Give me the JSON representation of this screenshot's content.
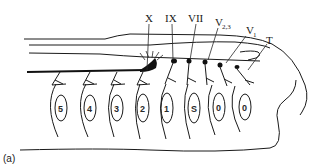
{
  "figure": {
    "panel_label": "(a)",
    "nerve_labels": [
      {
        "id": "X",
        "text": "X",
        "sub": ""
      },
      {
        "id": "IX",
        "text": "IX",
        "sub": ""
      },
      {
        "id": "VII",
        "text": "VII",
        "sub": ""
      },
      {
        "id": "V23",
        "text": "V",
        "sub": "2,3"
      },
      {
        "id": "V1",
        "text": "V",
        "sub": "1"
      },
      {
        "id": "T",
        "text": "T",
        "sub": ""
      }
    ],
    "segment_labels": [
      "5",
      "4",
      "3",
      "2",
      "1",
      "S",
      "0",
      "0"
    ],
    "colors": {
      "ink": "#1a1a1a",
      "background": "#ffffff"
    }
  }
}
